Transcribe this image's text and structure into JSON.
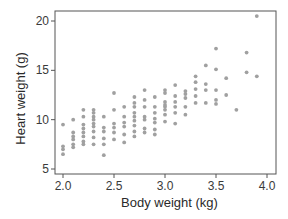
{
  "chart_data": {
    "type": "scatter",
    "title": "",
    "xlabel": "Body weight (kg)",
    "ylabel": "Heart weight (g)",
    "xlim": [
      1.92,
      4.1
    ],
    "ylim": [
      4.5,
      21.5
    ],
    "xticks": [
      2.0,
      2.5,
      3.0,
      3.5,
      4.0
    ],
    "xtick_labels": [
      "2.0",
      "2.5",
      "3.0",
      "3.5",
      "4.0"
    ],
    "yticks": [
      5,
      10,
      15,
      20
    ],
    "ytick_labels": [
      "5",
      "10",
      "15",
      "20"
    ],
    "grid": false,
    "legend": null,
    "point_color": "#a0a0a0",
    "frame_color": "#555555",
    "series": [
      {
        "name": "cats",
        "points": [
          [
            2.0,
            9.5
          ],
          [
            2.0,
            7.3
          ],
          [
            2.0,
            7.0
          ],
          [
            2.0,
            6.5
          ],
          [
            2.1,
            10.0
          ],
          [
            2.1,
            8.7
          ],
          [
            2.1,
            8.3
          ],
          [
            2.1,
            8.0
          ],
          [
            2.1,
            7.5
          ],
          [
            2.1,
            7.2
          ],
          [
            2.2,
            11.0
          ],
          [
            2.2,
            10.3
          ],
          [
            2.2,
            9.5
          ],
          [
            2.2,
            9.1
          ],
          [
            2.2,
            8.7
          ],
          [
            2.2,
            8.3
          ],
          [
            2.2,
            7.8
          ],
          [
            2.2,
            7.5
          ],
          [
            2.3,
            11.0
          ],
          [
            2.3,
            10.7
          ],
          [
            2.3,
            10.3
          ],
          [
            2.3,
            10.0
          ],
          [
            2.3,
            9.6
          ],
          [
            2.3,
            9.3
          ],
          [
            2.3,
            8.8
          ],
          [
            2.3,
            8.2
          ],
          [
            2.3,
            7.5
          ],
          [
            2.4,
            10.3
          ],
          [
            2.4,
            9.2
          ],
          [
            2.4,
            8.8
          ],
          [
            2.4,
            8.1
          ],
          [
            2.4,
            7.5
          ],
          [
            2.4,
            6.4
          ],
          [
            2.5,
            12.7
          ],
          [
            2.5,
            11.0
          ],
          [
            2.5,
            9.6
          ],
          [
            2.5,
            9.2
          ],
          [
            2.5,
            8.7
          ],
          [
            2.5,
            8.0
          ],
          [
            2.6,
            11.3
          ],
          [
            2.6,
            10.3
          ],
          [
            2.6,
            9.7
          ],
          [
            2.6,
            9.3
          ],
          [
            2.6,
            8.5
          ],
          [
            2.6,
            7.7
          ],
          [
            2.7,
            12.3
          ],
          [
            2.7,
            11.7
          ],
          [
            2.7,
            11.3
          ],
          [
            2.7,
            10.7
          ],
          [
            2.7,
            10.3
          ],
          [
            2.7,
            9.9
          ],
          [
            2.7,
            9.4
          ],
          [
            2.7,
            8.8
          ],
          [
            2.7,
            8.3
          ],
          [
            2.8,
            13.0
          ],
          [
            2.8,
            12.0
          ],
          [
            2.8,
            11.3
          ],
          [
            2.8,
            10.3
          ],
          [
            2.8,
            10.0
          ],
          [
            2.8,
            9.1
          ],
          [
            2.8,
            8.7
          ],
          [
            2.9,
            12.3
          ],
          [
            2.9,
            11.3
          ],
          [
            2.9,
            10.7
          ],
          [
            2.9,
            10.1
          ],
          [
            2.9,
            9.7
          ],
          [
            2.9,
            9.0
          ],
          [
            2.9,
            8.5
          ],
          [
            3.0,
            13.0
          ],
          [
            3.0,
            12.7
          ],
          [
            3.0,
            11.8
          ],
          [
            3.0,
            11.5
          ],
          [
            3.0,
            11.3
          ],
          [
            3.0,
            11.0
          ],
          [
            3.0,
            10.5
          ],
          [
            3.0,
            9.8
          ],
          [
            3.1,
            13.5
          ],
          [
            3.1,
            12.4
          ],
          [
            3.1,
            11.8
          ],
          [
            3.1,
            11.3
          ],
          [
            3.1,
            10.7
          ],
          [
            3.1,
            9.6
          ],
          [
            3.2,
            12.9
          ],
          [
            3.2,
            12.6
          ],
          [
            3.2,
            12.2
          ],
          [
            3.2,
            11.3
          ],
          [
            3.2,
            10.5
          ],
          [
            3.3,
            14.4
          ],
          [
            3.3,
            13.8
          ],
          [
            3.3,
            13.1
          ],
          [
            3.3,
            12.4
          ],
          [
            3.3,
            11.7
          ],
          [
            3.4,
            15.5
          ],
          [
            3.4,
            13.6
          ],
          [
            3.4,
            13.0
          ],
          [
            3.4,
            11.7
          ],
          [
            3.5,
            17.2
          ],
          [
            3.5,
            15.1
          ],
          [
            3.5,
            13.0
          ],
          [
            3.5,
            12.0
          ],
          [
            3.5,
            11.6
          ],
          [
            3.6,
            14.2
          ],
          [
            3.6,
            12.5
          ],
          [
            3.7,
            11.0
          ],
          [
            3.8,
            16.8
          ],
          [
            3.8,
            14.8
          ],
          [
            3.9,
            20.5
          ],
          [
            3.9,
            14.4
          ]
        ]
      }
    ]
  }
}
